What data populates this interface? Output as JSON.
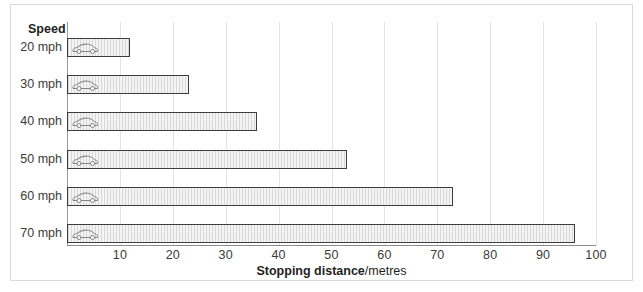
{
  "legend_header": "Speed",
  "axis_title": {
    "bold_part": "Stopping distance",
    "regular_part": "/metres"
  },
  "icon": "car-icon",
  "chart_data": {
    "type": "bar",
    "orientation": "horizontal",
    "title": "",
    "xlabel": "Stopping distance/metres",
    "ylabel": "Speed",
    "categories": [
      "20 mph",
      "30 mph",
      "40 mph",
      "50 mph",
      "60 mph",
      "70 mph"
    ],
    "values": [
      12,
      23,
      36,
      53,
      73,
      96
    ],
    "xlim": [
      0,
      100
    ],
    "xticks": [
      0,
      10,
      20,
      30,
      40,
      50,
      60,
      70,
      80,
      90,
      100
    ],
    "xtick_labels": [
      "",
      "10",
      "20",
      "30",
      "40",
      "50",
      "60",
      "70",
      "80",
      "90",
      "100"
    ],
    "grid": true,
    "legend": false,
    "bar_fill": "#f2f2f2",
    "bar_edge": "#3d3d3d",
    "gridline_color": "#e4e4e4"
  }
}
